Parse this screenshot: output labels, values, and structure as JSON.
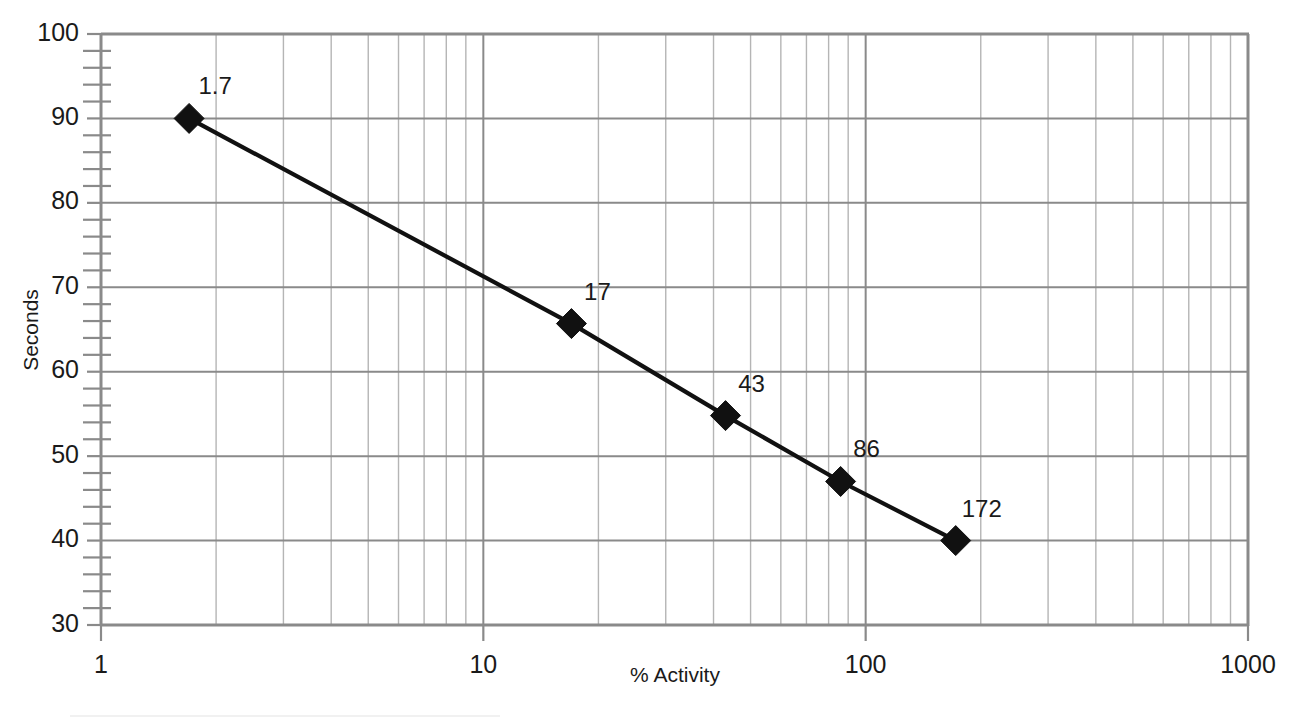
{
  "chart_data": {
    "type": "line",
    "title": "",
    "subtitle": "",
    "xlabel": "% Activity",
    "ylabel": "Seconds",
    "xscale": "log",
    "yscale": "linear",
    "xlim": [
      1,
      1000
    ],
    "ylim": [
      30,
      100
    ],
    "grid": true,
    "legend": "none",
    "x_tick_labels": [
      "1",
      "10",
      "100",
      "1000"
    ],
    "x_tick_values": [
      1,
      10,
      100,
      1000
    ],
    "y_tick_labels": [
      "30",
      "40",
      "50",
      "60",
      "70",
      "80",
      "90",
      "100"
    ],
    "y_tick_values": [
      30,
      40,
      50,
      60,
      70,
      80,
      90,
      100
    ],
    "y_minor_tick_step": 2,
    "x_minor_gridlines": [
      2,
      3,
      4,
      5,
      6,
      7,
      8,
      9
    ],
    "series": [
      {
        "name": "Seconds vs % Activity",
        "marker": "diamond",
        "marker_color": "#111111",
        "line_color": "#111111",
        "x": [
          1.7,
          17,
          43,
          86,
          172
        ],
        "y": [
          90,
          65.7,
          54.8,
          47,
          40
        ],
        "point_labels": [
          "1.7",
          "17",
          "43",
          "86",
          "172"
        ]
      }
    ],
    "annotations": []
  },
  "colors": {
    "background": "#ffffff",
    "major_grid": "#8a8a8a",
    "minor_grid": "#b5b5b5",
    "series": "#111111",
    "text": "#1a1a1a"
  },
  "axis_titles": {
    "x": "% Activity",
    "y": "Seconds"
  }
}
